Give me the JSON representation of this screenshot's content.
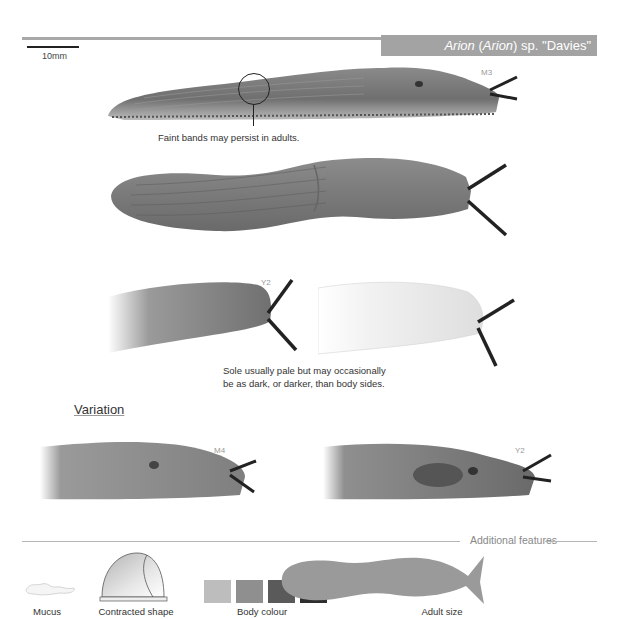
{
  "header": {
    "title_genus": "Arion",
    "title_subgenus": "(Arion)",
    "title_rest": "sp. \"Davies\"",
    "scale_label": "10mm"
  },
  "main": {
    "specimens": [
      {
        "id": "slug-1",
        "tag": "M3"
      },
      {
        "id": "slug-2",
        "tag": ""
      },
      {
        "id": "slug-3a",
        "tag": "Y2"
      },
      {
        "id": "slug-3b",
        "tag": ""
      }
    ],
    "captions": {
      "bands": "Faint bands may persist in adults.",
      "sole_line1": "Sole usually pale but may occasionally",
      "sole_line2": "be as dark, or darker, than body sides."
    },
    "variation": {
      "heading": "Variation",
      "items": [
        {
          "tag": "M4"
        },
        {
          "tag": "Y2"
        }
      ]
    }
  },
  "additional": {
    "heading": "Additional features",
    "items": [
      {
        "label": "Mucus"
      },
      {
        "label": "Contracted shape"
      },
      {
        "label": "Body colour"
      },
      {
        "label": "Adult size"
      }
    ],
    "body_colours": [
      "#bdbdbd",
      "#8f8f8f",
      "#5a5a5a",
      "#2e2e2e"
    ],
    "silhouette_color": "#9a9a9a"
  }
}
